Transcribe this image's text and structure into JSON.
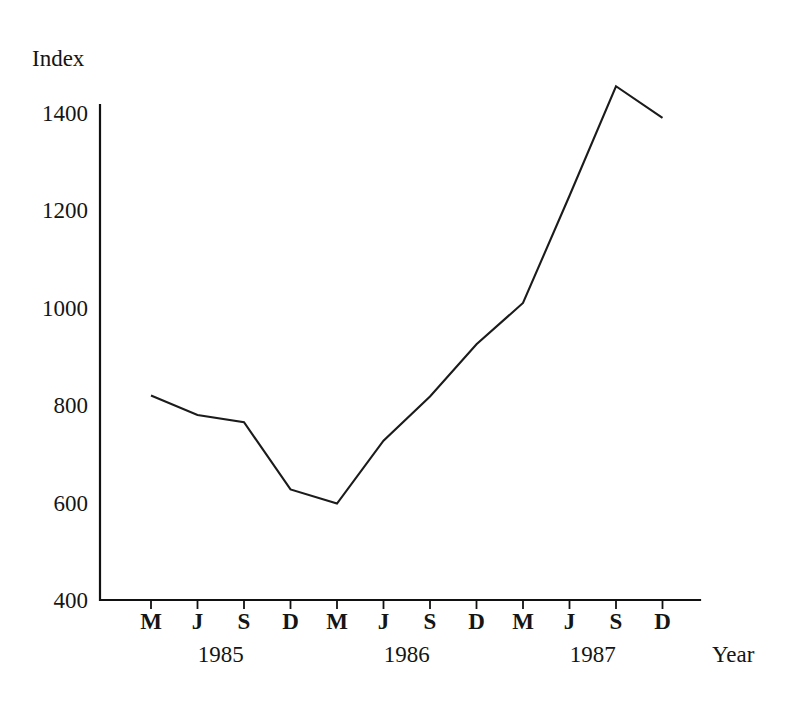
{
  "chart_data": {
    "type": "line",
    "title": "",
    "ylabel": "Index",
    "xlabel": "Year",
    "ylim": [
      400,
      1500
    ],
    "yticks": [
      400,
      600,
      800,
      1000,
      1200,
      1400
    ],
    "ytick_labels": [
      "400",
      "600",
      "800",
      "1000",
      "1200",
      "1400"
    ],
    "grid": false,
    "legend": "none",
    "x_tick_labels": [
      "M",
      "J",
      "S",
      "D",
      "M",
      "J",
      "S",
      "D",
      "M",
      "J",
      "S",
      "D"
    ],
    "x_group_labels": [
      "1985",
      "1986",
      "1987"
    ],
    "categories": [
      "M 1985",
      "J 1985",
      "S 1985",
      "D 1985",
      "M 1986",
      "J 1986",
      "S 1986",
      "D 1986",
      "M 1987",
      "J 1987",
      "S 1987",
      "D 1987"
    ],
    "values": [
      820,
      780,
      765,
      627,
      598,
      727,
      818,
      925,
      1010,
      1230,
      1455,
      1390
    ],
    "line_color": "#1b1b1b",
    "background_color": "#ffffff"
  },
  "axes": {
    "y_axis_title": "Index",
    "x_axis_title": "Year"
  }
}
